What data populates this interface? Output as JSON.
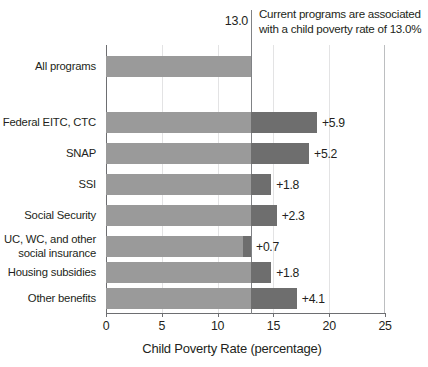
{
  "chart_data": {
    "type": "bar",
    "orientation": "horizontal",
    "stacked": true,
    "title": "",
    "xlabel": "Child Poverty Rate (percentage)",
    "ylabel": "",
    "xlim": [
      0,
      25
    ],
    "xticks": [
      0,
      5,
      10,
      15,
      20,
      25
    ],
    "xtick_labels": [
      "0",
      "5",
      "10",
      "15",
      "20",
      "25"
    ],
    "grid": true,
    "grid_axis": "x",
    "legend": "none",
    "baseline_value": 13.0,
    "baseline_label": "13.0",
    "annotation": "Current programs are associated with a child poverty rate of 13.0%",
    "categories": [
      "All programs",
      "Federal EITC, CTC",
      "SNAP",
      "SSI",
      "Social Security",
      "UC, WC, and other social insurance",
      "Housing subsidies",
      "Other benefits"
    ],
    "series": [
      {
        "name": "Child poverty rate with program",
        "values": [
          13.0,
          13.0,
          13.0,
          13.0,
          13.0,
          12.3,
          13.0,
          13.0
        ]
      },
      {
        "name": "Increase if program removed",
        "values": [
          0,
          5.9,
          5.2,
          1.8,
          2.3,
          0.7,
          1.8,
          4.1
        ]
      }
    ],
    "totals": [
      13.0,
      18.9,
      18.2,
      14.8,
      15.3,
      13.0,
      14.8,
      17.1
    ],
    "data_labels": [
      "",
      "+5.9",
      "+5.2",
      "+1.8",
      "+2.3",
      "+0.7",
      "+1.8",
      "+4.1"
    ],
    "colors": {
      "base_bar": "#9a9a9a",
      "extra_bar": "#6e6e6e",
      "reference_line": "#808285",
      "axis": "#6d6e71",
      "gridline": "#e3e3e4",
      "text": "#231f20"
    }
  },
  "axis": {
    "x_title": "Child Poverty Rate (percentage)"
  },
  "reference": {
    "value_label": "13.0",
    "annotation_line1": "Current programs are associated",
    "annotation_line2": "with a child poverty rate of 13.0%"
  },
  "categories": [
    {
      "label": "All programs",
      "line1": "All programs",
      "line2": ""
    },
    {
      "label": "Federal EITC, CTC",
      "line1": "Federal EITC, CTC",
      "line2": ""
    },
    {
      "label": "SNAP",
      "line1": "SNAP",
      "line2": ""
    },
    {
      "label": "SSI",
      "line1": "SSI",
      "line2": ""
    },
    {
      "label": "Social Security",
      "line1": "Social Security",
      "line2": ""
    },
    {
      "label": "UC, WC, and other social insurance",
      "line1": "UC, WC, and other",
      "line2": "social insurance"
    },
    {
      "label": "Housing subsidies",
      "line1": "Housing subsidies",
      "line2": ""
    },
    {
      "label": "Other benefits",
      "line1": "Other benefits",
      "line2": ""
    }
  ]
}
